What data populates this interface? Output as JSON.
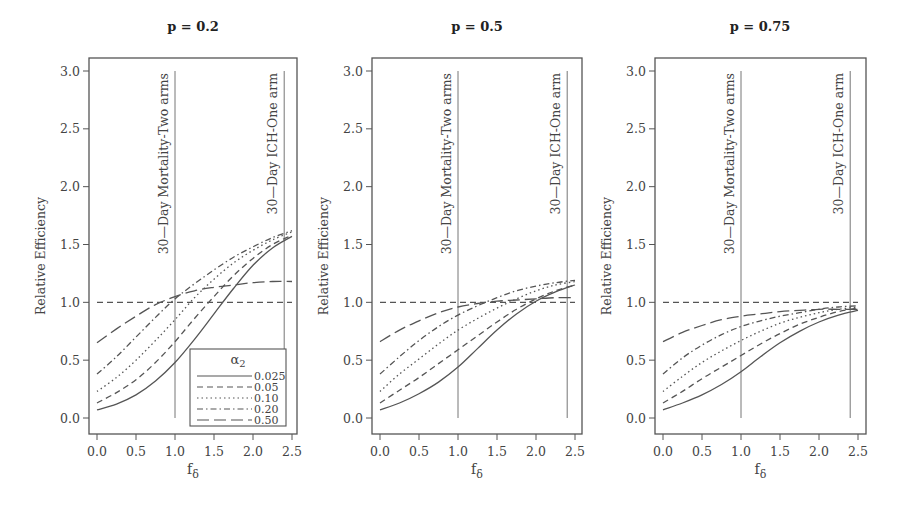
{
  "chart_data": [
    {
      "type": "line",
      "title": "p = 0.2",
      "xlabel": "f_δ",
      "ylabel": "Relative Efficiency",
      "xlim": [
        -0.1,
        2.6
      ],
      "ylim": [
        -0.1,
        3.1
      ],
      "xticks": [
        "0.0",
        "0.5",
        "1.0",
        "1.5",
        "2.0",
        "2.5"
      ],
      "yticks": [
        "0.0",
        "0.5",
        "1.0",
        "1.5",
        "2.0",
        "2.5",
        "3.0"
      ],
      "grid": false,
      "reference_line": {
        "y": 1.0,
        "style": "dashed"
      },
      "vlines": [
        {
          "x": 1.0,
          "label": "30—Day Mortality-Two arms"
        },
        {
          "x": 2.4,
          "label": "30—Day ICH-One arm"
        }
      ],
      "legend": {
        "title": "α2",
        "position": "lower right",
        "entries": [
          "0.025",
          "0.05",
          "0.10",
          "0.20",
          "0.50"
        ]
      },
      "x": [
        0.0,
        0.25,
        0.5,
        0.75,
        1.0,
        1.25,
        1.5,
        1.75,
        2.0,
        2.25,
        2.5
      ],
      "series": [
        {
          "name": "0.025",
          "style": "solid",
          "values": [
            0.07,
            0.12,
            0.2,
            0.32,
            0.48,
            0.68,
            0.9,
            1.12,
            1.32,
            1.47,
            1.57
          ]
        },
        {
          "name": "0.05",
          "style": "dashed",
          "values": [
            0.13,
            0.22,
            0.33,
            0.48,
            0.66,
            0.86,
            1.05,
            1.23,
            1.38,
            1.5,
            1.58
          ]
        },
        {
          "name": "0.10",
          "style": "dotted",
          "values": [
            0.23,
            0.35,
            0.5,
            0.67,
            0.85,
            1.04,
            1.2,
            1.34,
            1.45,
            1.54,
            1.61
          ]
        },
        {
          "name": "0.20",
          "style": "dashdot",
          "values": [
            0.38,
            0.53,
            0.7,
            0.87,
            1.03,
            1.16,
            1.28,
            1.39,
            1.48,
            1.56,
            1.62
          ]
        },
        {
          "name": "0.50",
          "style": "longdash",
          "values": [
            0.65,
            0.77,
            0.88,
            0.98,
            1.05,
            1.1,
            1.13,
            1.15,
            1.17,
            1.18,
            1.18
          ]
        }
      ]
    },
    {
      "type": "line",
      "title": "p = 0.5",
      "xlabel": "f_δ",
      "ylabel": "Relative Efficiency",
      "xlim": [
        -0.1,
        2.6
      ],
      "ylim": [
        -0.1,
        3.1
      ],
      "xticks": [
        "0.0",
        "0.5",
        "1.0",
        "1.5",
        "2.0",
        "2.5"
      ],
      "yticks": [
        "0.0",
        "0.5",
        "1.0",
        "1.5",
        "2.0",
        "2.5",
        "3.0"
      ],
      "grid": false,
      "reference_line": {
        "y": 1.0,
        "style": "dashed"
      },
      "vlines": [
        {
          "x": 1.0,
          "label": "30—Day Mortality-Two arms"
        },
        {
          "x": 2.4,
          "label": "30—Day ICH-One arm"
        }
      ],
      "x": [
        0.0,
        0.25,
        0.5,
        0.75,
        1.0,
        1.25,
        1.5,
        1.75,
        2.0,
        2.25,
        2.5
      ],
      "series": [
        {
          "name": "0.025",
          "style": "solid",
          "values": [
            0.07,
            0.13,
            0.21,
            0.31,
            0.44,
            0.6,
            0.76,
            0.9,
            1.01,
            1.09,
            1.15
          ]
        },
        {
          "name": "0.05",
          "style": "dashed",
          "values": [
            0.13,
            0.24,
            0.35,
            0.47,
            0.59,
            0.71,
            0.83,
            0.94,
            1.03,
            1.1,
            1.15
          ]
        },
        {
          "name": "0.10",
          "style": "dotted",
          "values": [
            0.23,
            0.38,
            0.51,
            0.64,
            0.76,
            0.86,
            0.95,
            1.03,
            1.1,
            1.15,
            1.18
          ]
        },
        {
          "name": "0.20",
          "style": "dashdot",
          "values": [
            0.38,
            0.53,
            0.67,
            0.79,
            0.89,
            0.97,
            1.04,
            1.1,
            1.14,
            1.17,
            1.19
          ]
        },
        {
          "name": "0.50",
          "style": "longdash",
          "values": [
            0.66,
            0.76,
            0.84,
            0.91,
            0.96,
            0.99,
            1.01,
            1.02,
            1.03,
            1.04,
            1.04
          ]
        }
      ]
    },
    {
      "type": "line",
      "title": "p = 0.75",
      "xlabel": "f_δ",
      "ylabel": "Relative Efficiency",
      "xlim": [
        -0.1,
        2.6
      ],
      "ylim": [
        -0.1,
        3.1
      ],
      "xticks": [
        "0.0",
        "0.5",
        "1.0",
        "1.5",
        "2.0",
        "2.5"
      ],
      "yticks": [
        "0.0",
        "0.5",
        "1.0",
        "1.5",
        "2.0",
        "2.5",
        "3.0"
      ],
      "grid": false,
      "reference_line": {
        "y": 1.0,
        "style": "dashed"
      },
      "vlines": [
        {
          "x": 1.0,
          "label": "30—Day Mortality-Two arms"
        },
        {
          "x": 2.4,
          "label": "30—Day ICH-One arm"
        }
      ],
      "x": [
        0.0,
        0.25,
        0.5,
        0.75,
        1.0,
        1.25,
        1.5,
        1.75,
        2.0,
        2.25,
        2.5
      ],
      "series": [
        {
          "name": "0.025",
          "style": "solid",
          "values": [
            0.07,
            0.13,
            0.2,
            0.29,
            0.4,
            0.53,
            0.65,
            0.75,
            0.83,
            0.89,
            0.93
          ]
        },
        {
          "name": "0.05",
          "style": "dashed",
          "values": [
            0.13,
            0.23,
            0.34,
            0.44,
            0.54,
            0.64,
            0.73,
            0.81,
            0.87,
            0.92,
            0.95
          ]
        },
        {
          "name": "0.10",
          "style": "dotted",
          "values": [
            0.23,
            0.36,
            0.48,
            0.58,
            0.67,
            0.75,
            0.82,
            0.87,
            0.91,
            0.94,
            0.96
          ]
        },
        {
          "name": "0.20",
          "style": "dashdot",
          "values": [
            0.38,
            0.52,
            0.63,
            0.72,
            0.79,
            0.84,
            0.88,
            0.91,
            0.94,
            0.96,
            0.97
          ]
        },
        {
          "name": "0.50",
          "style": "longdash",
          "values": [
            0.66,
            0.74,
            0.8,
            0.85,
            0.88,
            0.9,
            0.92,
            0.93,
            0.94,
            0.94,
            0.94
          ]
        }
      ]
    }
  ],
  "panels_layout": [
    {
      "box": [
        89,
        58,
        297,
        434
      ],
      "x0px": 97,
      "x1px": 175,
      "y0px": 418,
      "y3px": 71,
      "title_x": 193,
      "title_y": 27
    },
    {
      "box": [
        372,
        58,
        582,
        434
      ],
      "x0px": 380,
      "x1px": 458,
      "y0px": 418,
      "y3px": 71,
      "title_x": 477,
      "title_y": 27
    },
    {
      "box": [
        655,
        58,
        866,
        434
      ],
      "x0px": 663,
      "x1px": 741,
      "y0px": 418,
      "y3px": 71,
      "title_x": 760,
      "title_y": 27
    }
  ]
}
